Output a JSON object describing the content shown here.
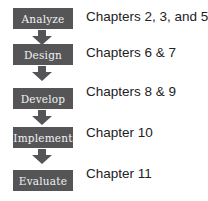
{
  "diagram": {
    "type": "flowchart",
    "colors": {
      "box": "#555557",
      "box_text": "#f2f2f2",
      "label_text": "#222222"
    },
    "steps": [
      {
        "name": "Analyze",
        "chapters": "Chapters 2, 3, and 5"
      },
      {
        "name": "Design",
        "chapters": "Chapters 6 & 7"
      },
      {
        "name": "Develop",
        "chapters": "Chapters 8 & 9"
      },
      {
        "name": "Implement",
        "chapters": "Chapter 10"
      },
      {
        "name": "Evaluate",
        "chapters": "Chapter 11"
      }
    ]
  }
}
